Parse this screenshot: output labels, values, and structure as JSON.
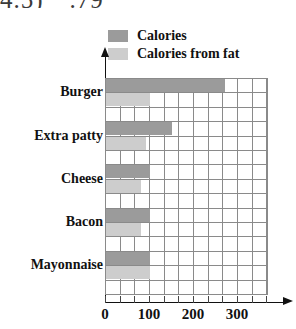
{
  "top_fragment": {
    "left": "4.5)",
    "right": ".79"
  },
  "legend": {
    "position": "top",
    "items": [
      {
        "label": "Calories",
        "color": "#9b9b9b",
        "name": "calories"
      },
      {
        "label": "Calories from fat",
        "color": "#cdcdcd",
        "name": "calories-from-fat"
      }
    ]
  },
  "chart_data": {
    "type": "bar",
    "orientation": "horizontal",
    "title": "",
    "xlabel": "",
    "ylabel": "",
    "categories": [
      "Burger",
      "Extra patty",
      "Cheese",
      "Bacon",
      "Mayonnaise"
    ],
    "series": [
      {
        "name": "Calories",
        "color": "#9b9b9b",
        "values": [
          270,
          150,
          100,
          100,
          100
        ]
      },
      {
        "name": "Calories from fat",
        "color": "#cdcdcd",
        "values": [
          100,
          90,
          80,
          80,
          100
        ]
      }
    ],
    "xlim": [
      0,
      370
    ],
    "xticks": [
      0,
      100,
      200,
      300
    ],
    "xtick_labels": [
      "0",
      "100",
      "200",
      "300"
    ],
    "minor_tick_step": 33.3,
    "grid": true,
    "legend_position": "top"
  }
}
